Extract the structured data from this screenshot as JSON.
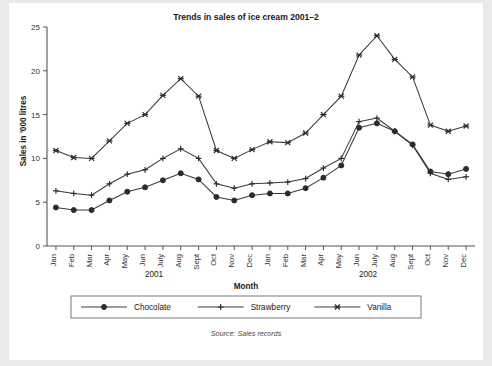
{
  "figure": {
    "title": "Trends in sales of ice cream 2001–2",
    "source_note": "Source: Sales records",
    "background_color": "#e9e9e9",
    "plot_background_color": "#ffffff",
    "ink_color": "#2b2b2b"
  },
  "axes": {
    "y_axis_label": "Sales in '000 litres",
    "x_axis_label": "Month",
    "y_ticks": [
      "0",
      "5",
      "10",
      "15",
      "20",
      "25"
    ],
    "group_labels": [
      "2001",
      "2002"
    ]
  },
  "legend": {
    "items": [
      {
        "label": "Chocolate",
        "marker": "filled-circle-marker"
      },
      {
        "label": "Strawberry",
        "marker": "plus-marker"
      },
      {
        "label": "Vanilla",
        "marker": "cross-marker"
      }
    ]
  },
  "chart_data": {
    "type": "line",
    "title": "Trends in sales of ice cream 2001–2",
    "xlabel": "Month",
    "ylabel": "Sales in '000 litres",
    "ylim": [
      0,
      25
    ],
    "ytick_values": [
      0,
      5,
      10,
      15,
      20,
      25
    ],
    "grid": false,
    "legend_position": "bottom",
    "categories": [
      "Jan",
      "Feb",
      "Mar",
      "Apr",
      "May",
      "Jun",
      "July",
      "Aug",
      "Sept",
      "Oct",
      "Nov",
      "Dec",
      "Jan",
      "Feb",
      "Mar",
      "Apr",
      "May",
      "Jun",
      "July",
      "Aug",
      "Sept",
      "Oct",
      "Nov",
      "Dec"
    ],
    "category_groups": [
      {
        "label": "2001",
        "start_index": 0,
        "end_index": 11
      },
      {
        "label": "2002",
        "start_index": 12,
        "end_index": 23
      }
    ],
    "series": [
      {
        "name": "Chocolate",
        "marker": "filled-circle-marker",
        "values": [
          4.4,
          4.1,
          4.1,
          5.2,
          6.2,
          6.7,
          7.5,
          8.3,
          7.6,
          5.6,
          5.2,
          5.8,
          6.0,
          6.0,
          6.6,
          7.8,
          9.2,
          13.5,
          14.0,
          13.1,
          11.6,
          8.5,
          8.2,
          8.8
        ]
      },
      {
        "name": "Strawberry",
        "marker": "plus-marker",
        "values": [
          6.3,
          6.0,
          5.8,
          7.1,
          8.2,
          8.7,
          10.0,
          11.1,
          10.0,
          7.1,
          6.6,
          7.1,
          7.2,
          7.3,
          7.7,
          8.9,
          10.0,
          14.2,
          14.6,
          13.1,
          11.5,
          8.3,
          7.6,
          7.9
        ]
      },
      {
        "name": "Vanilla",
        "marker": "cross-marker",
        "values": [
          10.9,
          10.1,
          10.0,
          12.0,
          14.0,
          15.0,
          17.2,
          19.1,
          17.1,
          10.9,
          10.0,
          11.0,
          11.9,
          11.8,
          12.9,
          15.0,
          17.1,
          21.8,
          24.0,
          21.3,
          19.3,
          13.8,
          13.1,
          13.7
        ]
      }
    ]
  }
}
